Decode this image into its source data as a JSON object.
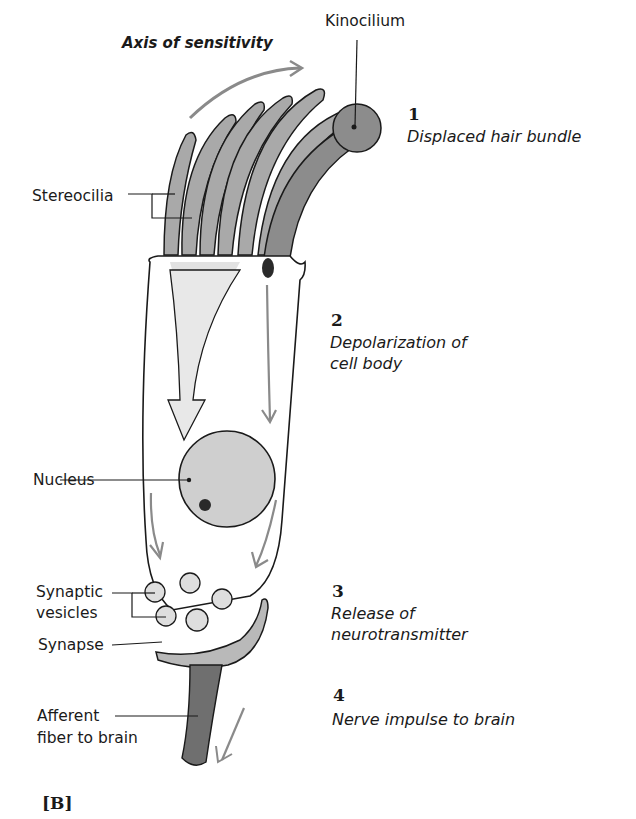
{
  "figure": {
    "panel_label": "[B]",
    "axis_label": "Axis of sensitivity",
    "labels": {
      "kinocilium": "Kinocilium",
      "stereocilia": "Stereocilia",
      "nucleus": "Nucleus",
      "synaptic_vesicles_line1": "Synaptic",
      "synaptic_vesicles_line2": "vesicles",
      "synapse": "Synapse",
      "afferent_line1": "Afferent",
      "afferent_line2": "fiber to brain"
    },
    "steps": [
      {
        "number": "1",
        "line1": "Displaced hair bundle",
        "line2": ""
      },
      {
        "number": "2",
        "line1": "Depolarization of",
        "line2": "cell body"
      },
      {
        "number": "3",
        "line1": "Release of",
        "line2": "neurotransmitter"
      },
      {
        "number": "4",
        "line1": "Nerve impulse to brain",
        "line2": ""
      }
    ],
    "colors": {
      "stereocilia_fill": "#a9a9a9",
      "kinocilium_fill": "#8c8c8c",
      "arrow_gray": "#8a8a8a",
      "outline": "#1a1a1a",
      "fiber_fill": "#6f6f6f"
    }
  }
}
